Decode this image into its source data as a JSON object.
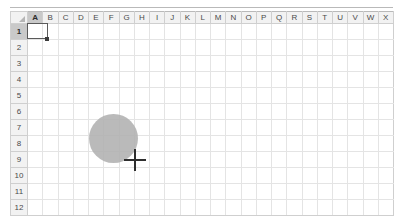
{
  "app": {
    "name": "spreadsheet-grid",
    "surface_color": "#ffffff",
    "gridline_color": "#e4e4e4",
    "header_fill": "#f2f2f2",
    "header_active_fill": "#c9c9c9",
    "header_text_color": "#4a4a4a"
  },
  "grid": {
    "select_all_label": "",
    "columns": [
      "A",
      "B",
      "C",
      "D",
      "E",
      "F",
      "G",
      "H",
      "I",
      "J",
      "K",
      "L",
      "M",
      "N",
      "O",
      "P",
      "Q",
      "R",
      "S",
      "T",
      "U",
      "V",
      "W",
      "X"
    ],
    "rows": [
      "1",
      "2",
      "3",
      "4",
      "5",
      "6",
      "7",
      "8",
      "9",
      "10",
      "11",
      "12"
    ],
    "active_column": "A",
    "active_row": "1",
    "cells": [
      [
        "",
        "",
        "",
        "",
        "",
        "",
        "",
        "",
        "",
        "",
        "",
        "",
        "",
        "",
        "",
        "",
        "",
        "",
        "",
        "",
        "",
        "",
        "",
        ""
      ],
      [
        "",
        "",
        "",
        "",
        "",
        "",
        "",
        "",
        "",
        "",
        "",
        "",
        "",
        "",
        "",
        "",
        "",
        "",
        "",
        "",
        "",
        "",
        "",
        ""
      ],
      [
        "",
        "",
        "",
        "",
        "",
        "",
        "",
        "",
        "",
        "",
        "",
        "",
        "",
        "",
        "",
        "",
        "",
        "",
        "",
        "",
        "",
        "",
        "",
        ""
      ],
      [
        "",
        "",
        "",
        "",
        "",
        "",
        "",
        "",
        "",
        "",
        "",
        "",
        "",
        "",
        "",
        "",
        "",
        "",
        "",
        "",
        "",
        "",
        "",
        ""
      ],
      [
        "",
        "",
        "",
        "",
        "",
        "",
        "",
        "",
        "",
        "",
        "",
        "",
        "",
        "",
        "",
        "",
        "",
        "",
        "",
        "",
        "",
        "",
        "",
        ""
      ],
      [
        "",
        "",
        "",
        "",
        "",
        "",
        "",
        "",
        "",
        "",
        "",
        "",
        "",
        "",
        "",
        "",
        "",
        "",
        "",
        "",
        "",
        "",
        "",
        ""
      ],
      [
        "",
        "",
        "",
        "",
        "",
        "",
        "",
        "",
        "",
        "",
        "",
        "",
        "",
        "",
        "",
        "",
        "",
        "",
        "",
        "",
        "",
        "",
        "",
        ""
      ],
      [
        "",
        "",
        "",
        "",
        "",
        "",
        "",
        "",
        "",
        "",
        "",
        "",
        "",
        "",
        "",
        "",
        "",
        "",
        "",
        "",
        "",
        "",
        "",
        ""
      ],
      [
        "",
        "",
        "",
        "",
        "",
        "",
        "",
        "",
        "",
        "",
        "",
        "",
        "",
        "",
        "",
        "",
        "",
        "",
        "",
        "",
        "",
        "",
        "",
        ""
      ],
      [
        "",
        "",
        "",
        "",
        "",
        "",
        "",
        "",
        "",
        "",
        "",
        "",
        "",
        "",
        "",
        "",
        "",
        "",
        "",
        "",
        "",
        "",
        "",
        ""
      ],
      [
        "",
        "",
        "",
        "",
        "",
        "",
        "",
        "",
        "",
        "",
        "",
        "",
        "",
        "",
        "",
        "",
        "",
        "",
        "",
        "",
        "",
        "",
        "",
        ""
      ],
      [
        "",
        "",
        "",
        "",
        "",
        "",
        "",
        "",
        "",
        "",
        "",
        "",
        "",
        "",
        "",
        "",
        "",
        "",
        "",
        "",
        "",
        "",
        "",
        ""
      ]
    ]
  },
  "selection": {
    "active_cell": "A1",
    "border_color": "#5a5a5a",
    "fill_handle_color": "#3c3c3c"
  },
  "shapes": [
    {
      "kind": "ellipse",
      "name": "gray-ellipse",
      "fill_color": "#b0b0b0",
      "left": 89,
      "top": 114,
      "width": 49,
      "height": 49
    }
  ],
  "cursor": {
    "kind": "crosshair",
    "color": "#2e2e2e",
    "x": 135,
    "y": 160
  }
}
